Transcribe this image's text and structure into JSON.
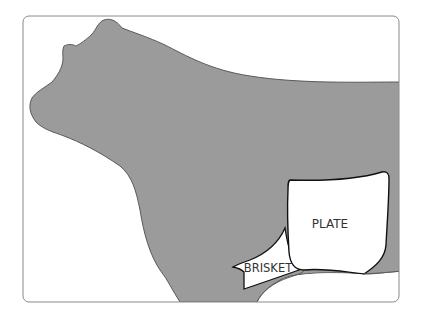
{
  "diagram": {
    "colors": {
      "body_fill": "#9b9b9b",
      "outline": "#3a3a3a",
      "frame": "#888888",
      "cut_fill": "#ffffff",
      "text": "#333333"
    },
    "cuts": [
      {
        "id": "plate",
        "label": "PLATE"
      },
      {
        "id": "brisket",
        "label": "BRISKET"
      }
    ]
  }
}
